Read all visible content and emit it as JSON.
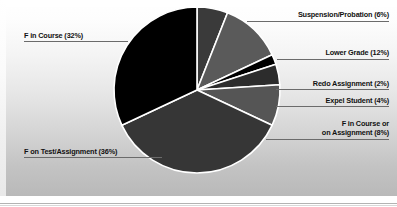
{
  "chart_data": {
    "type": "pie",
    "title": "",
    "categories": [
      "F in Course",
      "Suspension/Probation",
      "Lower Grade",
      "Redo Assignment",
      "Expel Student",
      "F in Course or on Assignment",
      "F on Test/Assignment"
    ],
    "values": [
      32,
      6,
      12,
      2,
      4,
      8,
      36
    ],
    "unit": "percent",
    "total": 100,
    "legend": "none",
    "labels_position": "outside-with-leader-lines",
    "grid": false,
    "slice_colors": [
      "#000000",
      "#3a3a3a",
      "#5a5a5a",
      "#000000",
      "#2c2c2c",
      "#555555",
      "#363636"
    ],
    "slices": [
      {
        "label": "F in Course",
        "value": 32,
        "text": "F in Course (32%)",
        "color": "#000000"
      },
      {
        "label": "Suspension/Probation",
        "value": 6,
        "text": "Suspension/Probation (6%)",
        "color": "#3a3a3a"
      },
      {
        "label": "Lower Grade",
        "value": 12,
        "text": "Lower Grade (12%)",
        "color": "#5a5a5a"
      },
      {
        "label": "Redo Assignment",
        "value": 2,
        "text": "Redo Assignment (2%)",
        "color": "#000000"
      },
      {
        "label": "Expel Student",
        "value": 4,
        "text": "Expel Student (4%)",
        "color": "#2c2c2c"
      },
      {
        "label": "F in Course or on Assignment",
        "value": 8,
        "text": "F in Course or on Assignment (8%)",
        "color": "#555555"
      },
      {
        "label": "F on Test/Assignment",
        "value": 36,
        "text": "F on Test/Assignment (36%)",
        "color": "#363636"
      }
    ]
  },
  "labels": {
    "f_in_course": "F in Course (32%)",
    "suspension_probation": "Suspension/Probation (6%)",
    "lower_grade": "Lower Grade (12%)",
    "redo_assignment": "Redo Assignment (2%)",
    "expel_student": "Expel Student (4%)",
    "f_in_course_or_line1": "F in Course or",
    "f_in_course_or_line2": "on Assignment (8%)",
    "f_on_test_assignment": "F on Test/Assignment (36%)"
  },
  "colors": {
    "leader_line": "#6b6b6b",
    "slice_outline": "#ffffff",
    "text": "#111111",
    "panel_top": "#ffffff",
    "panel_bottom": "#b9b9b9"
  }
}
